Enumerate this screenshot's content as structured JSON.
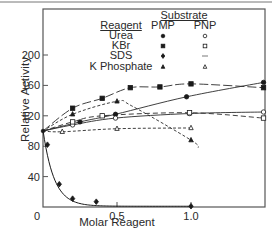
{
  "chart_data": {
    "type": "line",
    "title": "",
    "xlabel": "Molar Reagent",
    "ylabel": "Relative Activity",
    "xlim": [
      0,
      1.5
    ],
    "ylim": [
      0,
      260
    ],
    "x_ticks": [
      "0",
      "0.5",
      "1.0"
    ],
    "y_ticks": [
      "40",
      "80",
      "120",
      "160",
      "200"
    ],
    "grid": false,
    "legend": {
      "position": "upper-center",
      "reagent_header": "Reagent",
      "substrate_header": "Substrate",
      "columns": [
        "PMP",
        "PNP"
      ],
      "rows": [
        {
          "reagent": "Urea",
          "pmp_marker": "filled-circle",
          "pnp_marker": "open-circle"
        },
        {
          "reagent": "KBr",
          "pmp_marker": "filled-square",
          "pnp_marker": "open-square"
        },
        {
          "reagent": "SDS",
          "pmp_marker": "filled-diamond",
          "pnp_marker": "—"
        },
        {
          "reagent": "K Phosphate",
          "pmp_marker": "filled-triangle",
          "pnp_marker": "open-triangle"
        }
      ]
    },
    "series": [
      {
        "name": "KBr PMP",
        "marker": "filled-square",
        "line": "long-dash",
        "x": [
          0,
          0.2,
          0.4,
          0.59,
          0.79,
          1.0,
          1.49
        ],
        "y": [
          100,
          130,
          143,
          157,
          158,
          162,
          157
        ]
      },
      {
        "name": "Urea PMP",
        "marker": "filled-circle",
        "line": "solid",
        "x": [
          0,
          0.25,
          0.49,
          0.97,
          1.49
        ],
        "y": [
          100,
          112,
          122,
          145,
          164
        ]
      },
      {
        "name": "Urea PNP",
        "marker": "open-circle",
        "line": "solid",
        "x": [
          0,
          0.2,
          0.49,
          0.99,
          1.49
        ],
        "y": [
          100,
          108,
          117,
          123,
          125
        ]
      },
      {
        "name": "KBr PNP",
        "marker": "open-square",
        "line": "dash",
        "x": [
          0,
          0.2,
          0.4,
          0.99,
          1.49
        ],
        "y": [
          100,
          112,
          120,
          124,
          117
        ]
      },
      {
        "name": "K Phosphate PMP",
        "marker": "filled-triangle",
        "line": "short-dash",
        "x": [
          0,
          0.2,
          0.5,
          0.6,
          1.0,
          1.05
        ],
        "y": [
          100,
          122,
          139,
          133,
          88,
          78
        ]
      },
      {
        "name": "K Phosphate PNP",
        "marker": "open-triangle",
        "line": "short-dash",
        "x": [
          0,
          0.13,
          0.5,
          1.0
        ],
        "y": [
          100,
          99,
          103,
          104
        ]
      },
      {
        "name": "SDS PMP",
        "marker": "filled-diamond",
        "line": "solid",
        "x": [
          0,
          0.03,
          0.11,
          0.2,
          0.36,
          1.0
        ],
        "y": [
          100,
          82,
          30,
          11,
          7,
          1
        ]
      }
    ]
  }
}
